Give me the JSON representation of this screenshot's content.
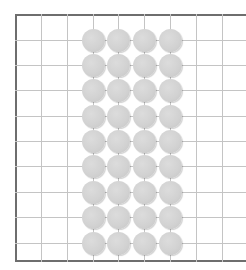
{
  "board": {
    "type": "grid-board",
    "border_color": "#6e6e6e",
    "grid_color": "#c4c4c4",
    "stone_color": "#d3d3d3",
    "vertical_lines_x": [
      41,
      67,
      93,
      118,
      144,
      170,
      196,
      222
    ],
    "horizontal_lines_y": [
      40,
      65,
      90,
      116,
      141,
      166,
      192,
      217,
      243
    ],
    "stones": {
      "columns_x": [
        93,
        118,
        144,
        170
      ],
      "rows_y": [
        40,
        65,
        90,
        116,
        141,
        166,
        192,
        217,
        243
      ],
      "count": 36
    }
  }
}
